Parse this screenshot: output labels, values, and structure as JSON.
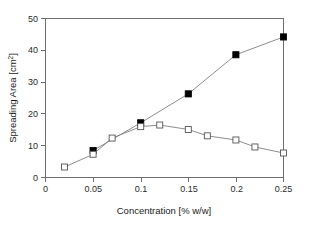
{
  "chart_data": {
    "type": "line",
    "title": "",
    "subtitle": "",
    "xlabel": "Concentration [% w/w]",
    "ylabel": "Spreading Area [cm2]",
    "ylabel_base": "Spreading Area [cm",
    "ylabel_sup": "2",
    "ylabel_tail": "]",
    "xlim": [
      0,
      0.25
    ],
    "ylim": [
      0,
      50
    ],
    "grid": false,
    "legend": "none",
    "xticks": [
      0,
      0.05,
      0.1,
      0.15,
      0.2,
      0.25
    ],
    "xtick_labels": [
      "0",
      "0.05",
      "0.1",
      "0.15",
      "0.2",
      "0.25"
    ],
    "yticks": [
      0,
      10,
      20,
      30,
      40,
      50
    ],
    "ytick_labels": [
      "0",
      "10",
      "20",
      "30",
      "40",
      "50"
    ],
    "series": [
      {
        "name": "filled-square-series",
        "marker": "filled-square",
        "x": [
          0.05,
          0.1,
          0.15,
          0.2,
          0.25
        ],
        "values": [
          8.5,
          17.2,
          26.3,
          38.6,
          44.2
        ]
      },
      {
        "name": "open-square-series",
        "marker": "open-square",
        "x": [
          0.02,
          0.05,
          0.07,
          0.1,
          0.12,
          0.15,
          0.17,
          0.2,
          0.22,
          0.25
        ],
        "values": [
          3.3,
          7.3,
          12.4,
          16.0,
          16.5,
          15.1,
          13.1,
          11.8,
          9.6,
          7.7
        ]
      }
    ],
    "colors": {
      "filled_marker": "#000000",
      "open_marker_fill": "#ffffff",
      "open_marker_stroke": "#555555",
      "line": "#808080",
      "axis": "#6e6e6e",
      "background": "#ffffff"
    }
  }
}
